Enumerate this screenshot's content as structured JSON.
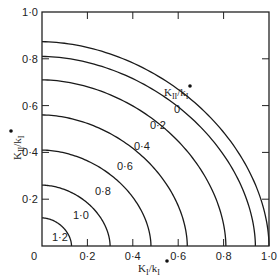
{
  "chart_data": {
    "type": "line",
    "title": "",
    "xlabel": "K_I/k_I*",
    "ylabel": "K_II/k_I*",
    "xlim": [
      0,
      1.0
    ],
    "ylim": [
      0,
      1.0
    ],
    "grid": false,
    "legend_title": "K_II/k_I*",
    "x_ticks": [
      "0",
      "0·2",
      "0·4",
      "0·6",
      "0·8",
      "1·0"
    ],
    "y_ticks": [
      "0",
      "0·2",
      "0·4",
      "0·6",
      "0·8",
      "1·0"
    ],
    "series": [
      {
        "name": "0",
        "label": "0",
        "x_intercept": 1.0,
        "y_intercept": 0.873,
        "exponent": 1.85,
        "label_pos": [
          174,
          113
        ]
      },
      {
        "name": "0.2",
        "label": "0·2",
        "x_intercept": 0.94,
        "y_intercept": 0.81,
        "exponent": 1.85,
        "label_pos": [
          150,
          129
        ]
      },
      {
        "name": "0.4",
        "label": "0·4",
        "x_intercept": 0.81,
        "y_intercept": 0.71,
        "exponent": 1.85,
        "label_pos": [
          134,
          150
        ]
      },
      {
        "name": "0.6",
        "label": "0·6",
        "x_intercept": 0.64,
        "y_intercept": 0.56,
        "exponent": 1.85,
        "label_pos": [
          117,
          170
        ]
      },
      {
        "name": "0.8",
        "label": "0·8",
        "x_intercept": 0.48,
        "y_intercept": 0.41,
        "exponent": 1.85,
        "label_pos": [
          95,
          195
        ]
      },
      {
        "name": "1.0",
        "label": "1·0",
        "x_intercept": 0.3,
        "y_intercept": 0.26,
        "exponent": 1.85,
        "label_pos": [
          73,
          219
        ]
      },
      {
        "name": "1.2",
        "label": "1·2",
        "x_intercept": 0.13,
        "y_intercept": 0.12,
        "exponent": 1.85,
        "label_pos": [
          52,
          241
        ]
      }
    ]
  }
}
